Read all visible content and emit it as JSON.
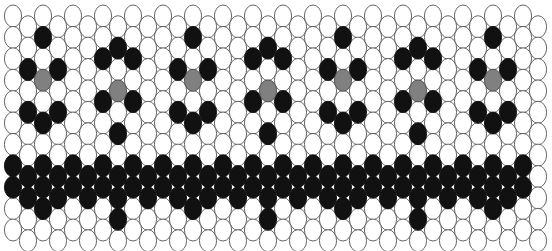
{
  "figure": {
    "width": 552,
    "height": 251,
    "background_color": "#ffffff"
  },
  "colors": {
    "empty_fill": "#ffffff",
    "empty_stroke": "#555555",
    "filled_fill": "#111111",
    "center_fill": "#808080",
    "center_stroke": "#4a4a4a"
  },
  "lattice": {
    "description": "Vertical ellipses packed in a staggered hexagonal lattice",
    "ellipse_rx": 8.6,
    "ellipse_ry": 11.0,
    "col_spacing": 15.0,
    "row_spacing": 21.4,
    "row_offset_odd": 10.7,
    "origin_x": 13.0,
    "origin_y": 16.0,
    "columns": 36,
    "rows": 11,
    "states": [
      "empty",
      "filled",
      "center"
    ]
  },
  "motifs": {
    "upper": {
      "name": "flower-defect",
      "count": 7,
      "center_row": 3,
      "center_columns": [
        2,
        7,
        12,
        17,
        22,
        27,
        32
      ],
      "structure": "gray center with six black neighbours in hexagonal ring",
      "ring_offsets": [
        {
          "dcol": 0,
          "drow": -2
        },
        {
          "dcol": 0,
          "drow": 2
        },
        {
          "dcol": -1,
          "drow": -1
        },
        {
          "dcol": -1,
          "drow": 1
        },
        {
          "dcol": 1,
          "drow": -1
        },
        {
          "dcol": 1,
          "drow": 1
        }
      ]
    },
    "lower": {
      "name": "stacked-defect",
      "count": 7,
      "center_row": 8,
      "center_columns": [
        2,
        7,
        12,
        17,
        22,
        27,
        32
      ],
      "structure": "black centre column of three with flanking columns of two",
      "filled_offsets": [
        {
          "dcol": 0,
          "drow": -1
        },
        {
          "dcol": 0,
          "drow": 0
        },
        {
          "dcol": 0,
          "drow": 1
        },
        {
          "dcol": -1,
          "drow": -1
        },
        {
          "dcol": -1,
          "drow": 0
        },
        {
          "dcol": 1,
          "drow": -1
        },
        {
          "dcol": 1,
          "drow": 0
        },
        {
          "dcol": -2,
          "drow": -1
        },
        {
          "dcol": -2,
          "drow": 0
        },
        {
          "dcol": 2,
          "drow": -1
        },
        {
          "dcol": 2,
          "drow": 0
        }
      ]
    }
  }
}
